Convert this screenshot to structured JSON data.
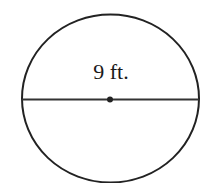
{
  "diagram": {
    "shape": "circle",
    "diameter_label": "9 ft.",
    "stroke_color": "#222222",
    "background": "#ffffff",
    "has_center_point": true,
    "has_diameter_line": true
  }
}
